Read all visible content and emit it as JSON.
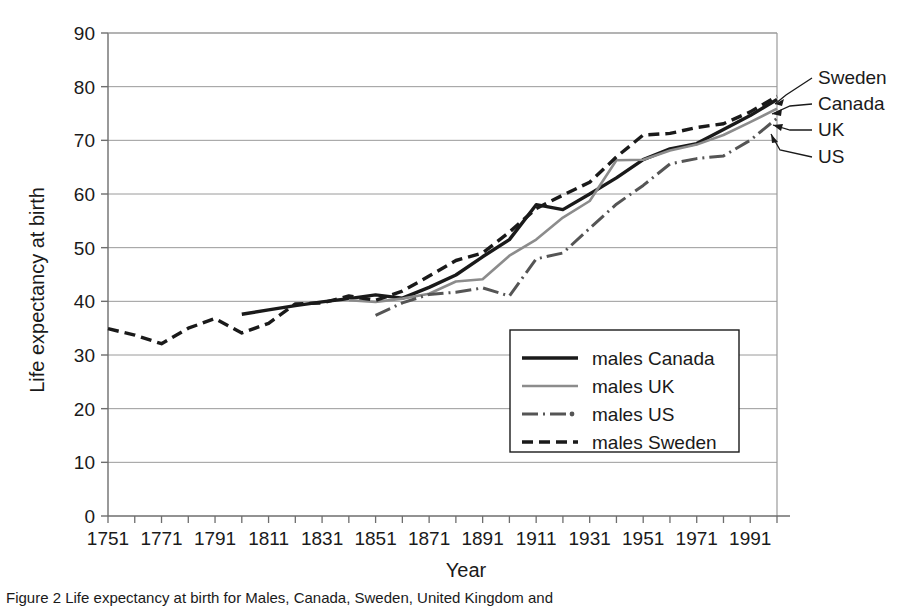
{
  "figure": {
    "caption": "Figure 2  Life expectancy at birth for Males, Canada, Sweden, United Kingdom and"
  },
  "chart_data": {
    "type": "line",
    "title": "",
    "xlabel": "Year",
    "ylabel": "Life expectancy at birth",
    "xlim": [
      1751,
      2001
    ],
    "ylim": [
      0,
      90
    ],
    "ytick_step": 10,
    "xtick_step": 10,
    "grid": "horizontal",
    "legend_position": "inside-bottom-right",
    "xticklabels": [
      "1751",
      "1771",
      "1791",
      "1811",
      "1831",
      "1851",
      "1871",
      "1891",
      "1911",
      "1931",
      "1951",
      "1971",
      "1991"
    ],
    "yticklabels": [
      "0",
      "10",
      "20",
      "30",
      "40",
      "50",
      "60",
      "70",
      "80",
      "90"
    ],
    "series": [
      {
        "name": "males Canada",
        "legend_label": "males Canada",
        "end_label": "Canada",
        "style": "solid-thick-black",
        "color": "#1a1a1a",
        "points": [
          [
            1801,
            37.6
          ],
          [
            1811,
            38.4
          ],
          [
            1821,
            39.2
          ],
          [
            1831,
            39.9
          ],
          [
            1841,
            40.5
          ],
          [
            1851,
            41.2
          ],
          [
            1861,
            40.6
          ],
          [
            1871,
            42.6
          ],
          [
            1881,
            44.9
          ],
          [
            1891,
            48.3
          ],
          [
            1901,
            51.5
          ],
          [
            1911,
            58.0
          ],
          [
            1921,
            57.1
          ],
          [
            1931,
            60.0
          ],
          [
            1941,
            63.0
          ],
          [
            1951,
            66.4
          ],
          [
            1961,
            68.4
          ],
          [
            1971,
            69.4
          ],
          [
            1981,
            72.0
          ],
          [
            1991,
            74.6
          ],
          [
            2001,
            77.6
          ]
        ]
      },
      {
        "name": "males UK",
        "legend_label": "males UK",
        "end_label": "UK",
        "style": "solid-thin-gray",
        "color": "#8c8c8c",
        "points": [
          [
            1841,
            40.2
          ],
          [
            1851,
            39.9
          ],
          [
            1861,
            40.5
          ],
          [
            1871,
            41.4
          ],
          [
            1881,
            43.7
          ],
          [
            1891,
            44.1
          ],
          [
            1901,
            48.5
          ],
          [
            1911,
            51.5
          ],
          [
            1921,
            55.6
          ],
          [
            1931,
            58.7
          ],
          [
            1941,
            66.3
          ],
          [
            1951,
            66.4
          ],
          [
            1961,
            68.1
          ],
          [
            1971,
            69.2
          ],
          [
            1981,
            71.0
          ],
          [
            1991,
            73.4
          ],
          [
            2001,
            75.9
          ]
        ]
      },
      {
        "name": "males US",
        "legend_label": "males US",
        "end_label": "US",
        "style": "dash-dot-gray",
        "color": "#4d4d4d",
        "points": [
          [
            1851,
            37.4
          ],
          [
            1861,
            39.7
          ],
          [
            1871,
            41.3
          ],
          [
            1881,
            41.7
          ],
          [
            1891,
            42.5
          ],
          [
            1901,
            41.0
          ],
          [
            1911,
            47.9
          ],
          [
            1921,
            49.0
          ],
          [
            1931,
            53.6
          ],
          [
            1941,
            58.1
          ],
          [
            1951,
            61.6
          ],
          [
            1961,
            65.6
          ],
          [
            1971,
            66.6
          ],
          [
            1981,
            67.1
          ],
          [
            1991,
            70.0
          ],
          [
            2001,
            74.1
          ]
        ]
      },
      {
        "name": "males Sweden",
        "legend_label": "males Sweden",
        "end_label": "Sweden",
        "style": "dashed-black",
        "color": "#1a1a1a",
        "points": [
          [
            1751,
            34.9
          ],
          [
            1761,
            33.7
          ],
          [
            1771,
            32.1
          ],
          [
            1781,
            35.0
          ],
          [
            1791,
            36.8
          ],
          [
            1801,
            34.1
          ],
          [
            1811,
            35.9
          ],
          [
            1821,
            39.5
          ],
          [
            1831,
            39.7
          ],
          [
            1841,
            41.0
          ],
          [
            1851,
            40.2
          ],
          [
            1861,
            41.9
          ],
          [
            1871,
            44.7
          ],
          [
            1881,
            47.6
          ],
          [
            1891,
            49.0
          ],
          [
            1901,
            52.9
          ],
          [
            1911,
            57.3
          ],
          [
            1921,
            59.8
          ],
          [
            1931,
            62.2
          ],
          [
            1941,
            66.9
          ],
          [
            1951,
            71.0
          ],
          [
            1961,
            71.3
          ],
          [
            1971,
            72.4
          ],
          [
            1981,
            73.1
          ],
          [
            1991,
            75.3
          ],
          [
            2001,
            78.2
          ]
        ]
      }
    ]
  },
  "legend": {
    "items": [
      {
        "label": "males Canada",
        "style": "solid-thick-black"
      },
      {
        "label": "males UK",
        "style": "solid-thin-gray"
      },
      {
        "label": "males US",
        "style": "dash-dot-gray"
      },
      {
        "label": "males Sweden",
        "style": "dashed-black"
      }
    ]
  },
  "end_labels": [
    {
      "text": "Sweden"
    },
    {
      "text": "Canada"
    },
    {
      "text": "UK"
    },
    {
      "text": "US"
    }
  ]
}
